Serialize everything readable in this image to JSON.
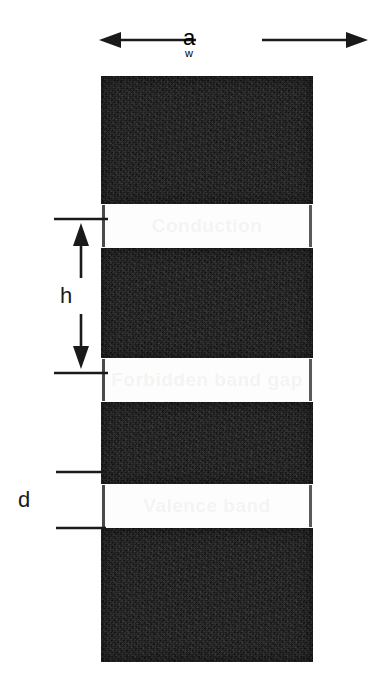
{
  "figure": {
    "type": "cross-section-diagram",
    "background_color": "#ffffff",
    "dark_layer_color": "#1d1c1c",
    "light_layer_color": "#fdfdfd",
    "annotation_color": "#1a1a1a"
  },
  "dimensions": {
    "a": {
      "label": "a",
      "sublabel": "w",
      "orientation": "horizontal",
      "arrow_style": "double-outward",
      "position": "top",
      "meaning": "overall width of the structure"
    },
    "h": {
      "label": "h",
      "orientation": "vertical",
      "arrow_style": "double-inward",
      "position": "left",
      "meaning": "height of one dark layer"
    },
    "d": {
      "label": "d",
      "orientation": "vertical",
      "arrow_style": "extension-lines-only",
      "position": "left",
      "meaning": "thickness of one light gap layer"
    }
  },
  "stack": {
    "x": 101,
    "y": 76,
    "width": 212,
    "height": 586,
    "bands": [
      {
        "kind": "dark",
        "top": 0,
        "height": 128,
        "ghost_text": ""
      },
      {
        "kind": "light",
        "top": 128,
        "height": 44,
        "ghost_text": "Conduction"
      },
      {
        "kind": "dark",
        "top": 172,
        "height": 110,
        "ghost_text": ""
      },
      {
        "kind": "light",
        "top": 282,
        "height": 44,
        "ghost_text": "Forbidden band gap"
      },
      {
        "kind": "dark",
        "top": 326,
        "height": 82,
        "ghost_text": ""
      },
      {
        "kind": "light",
        "top": 408,
        "height": 44,
        "ghost_text": "Valence band"
      },
      {
        "kind": "dark",
        "top": 452,
        "height": 134,
        "ghost_text": ""
      }
    ]
  }
}
